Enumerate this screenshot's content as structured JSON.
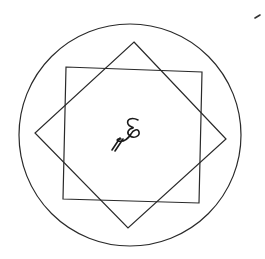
{
  "diagram": {
    "type": "geometric-figure",
    "background": "#ffffff",
    "stroke_color": "#2a2a2a",
    "shapes": [
      {
        "name": "outer-circle",
        "kind": "circle",
        "cx": 130,
        "cy": 135,
        "r": 111
      },
      {
        "name": "square",
        "kind": "polygon",
        "points": [
          [
            66,
            67
          ],
          [
            202,
            72
          ],
          [
            199,
            203
          ],
          [
            63,
            199
          ]
        ]
      },
      {
        "name": "diamond",
        "kind": "polygon",
        "points": [
          [
            134,
            42
          ],
          [
            226,
            139
          ],
          [
            128,
            228
          ],
          [
            35,
            133
          ]
        ]
      }
    ],
    "center_mark": {
      "text": "ع",
      "description": "handwritten Arabic-like glyph at center",
      "x": 108,
      "y": 118
    },
    "corner_mark": {
      "description": "small pen stroke at top-right",
      "x": 257,
      "y": 17
    }
  }
}
